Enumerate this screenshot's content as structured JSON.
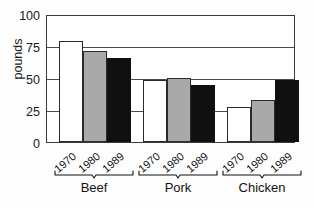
{
  "chart_data": {
    "type": "bar",
    "title": "",
    "subtitle": "",
    "xlabel": "",
    "ylabel": "pounds",
    "ylim": [
      0,
      100
    ],
    "yticks": [
      0,
      25,
      50,
      75,
      100
    ],
    "ytick_labels": [
      "0",
      "25",
      "50",
      "75",
      "100"
    ],
    "grid": true,
    "grid_axis": "y",
    "legend": false,
    "legend_position": "none",
    "categories": [
      "Beef",
      "Pork",
      "Chicken"
    ],
    "subcategories": [
      "1970",
      "1980",
      "1989"
    ],
    "series": [
      {
        "name": "1970",
        "fill": "white",
        "values": [
          80,
          49,
          28
        ]
      },
      {
        "name": "1980",
        "fill": "gray",
        "values": [
          72,
          51,
          33
        ]
      },
      {
        "name": "1989",
        "fill": "black",
        "values": [
          67,
          45,
          49
        ]
      }
    ],
    "groups": [
      {
        "name": "Beef",
        "bars": [
          {
            "year": "1970",
            "value": 80,
            "fill": "white"
          },
          {
            "year": "1980",
            "value": 72,
            "fill": "gray"
          },
          {
            "year": "1989",
            "value": 67,
            "fill": "black"
          }
        ]
      },
      {
        "name": "Pork",
        "bars": [
          {
            "year": "1970",
            "value": 49,
            "fill": "white"
          },
          {
            "year": "1980",
            "value": 51,
            "fill": "gray"
          },
          {
            "year": "1989",
            "value": 45,
            "fill": "black"
          }
        ]
      },
      {
        "name": "Chicken",
        "bars": [
          {
            "year": "1970",
            "value": 28,
            "fill": "white"
          },
          {
            "year": "1980",
            "value": 33,
            "fill": "gray"
          },
          {
            "year": "1989",
            "value": 49,
            "fill": "black"
          }
        ]
      }
    ],
    "colors": {
      "bar_white": "#ffffff",
      "bar_gray": "#a9a9a9",
      "bar_black": "#101010",
      "outline": "#2b2b2b",
      "axis": "#3a3a3a",
      "gridline": "#4a4a4a",
      "text": "#111111",
      "background": "#ffffff"
    }
  },
  "axis": {
    "y_title": "pounds",
    "y_tick_0": "0",
    "y_tick_25": "25",
    "y_tick_50": "50",
    "y_tick_75": "75",
    "y_tick_100": "100"
  },
  "groups": {
    "beef": {
      "name": "Beef",
      "year_1970": "1970",
      "year_1980": "1980",
      "year_1989": "1989"
    },
    "pork": {
      "name": "Pork",
      "year_1970": "1970",
      "year_1980": "1980",
      "year_1989": "1989"
    },
    "chicken": {
      "name": "Chicken",
      "year_1970": "1970",
      "year_1980": "1980",
      "year_1989": "1989"
    }
  }
}
